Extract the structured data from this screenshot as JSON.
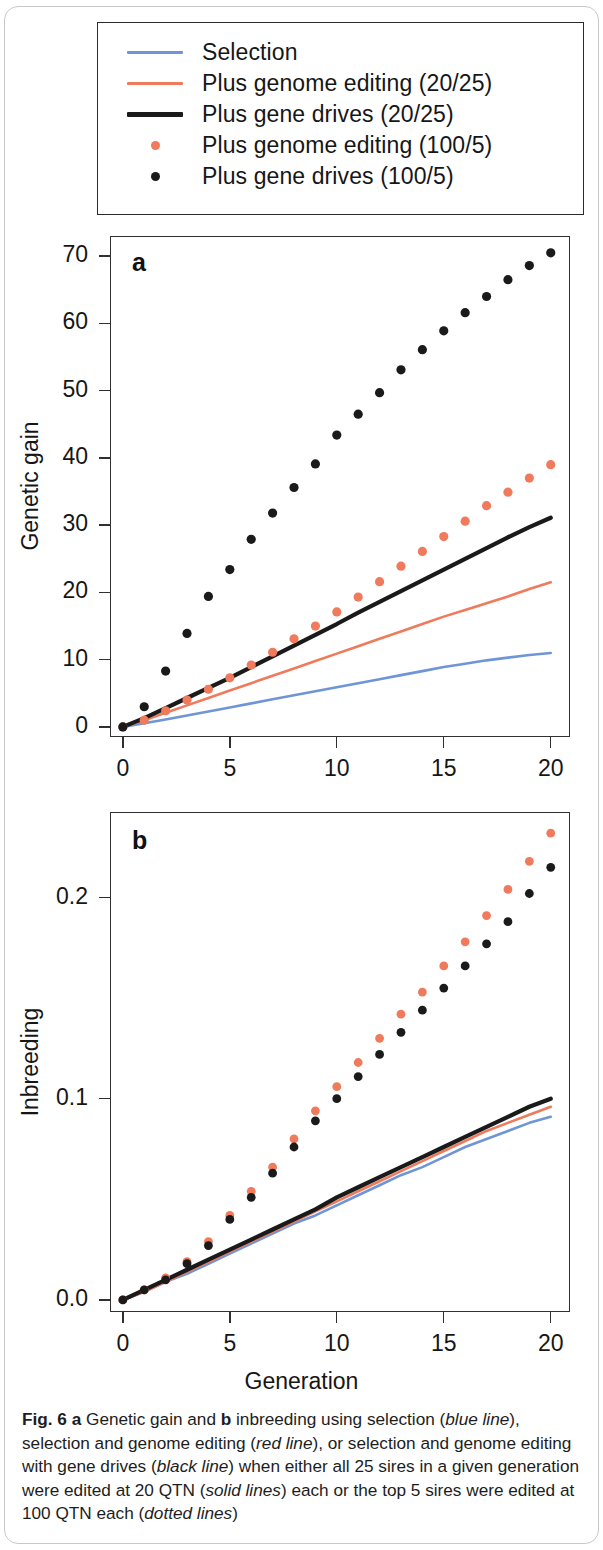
{
  "figure": {
    "label": "Fig. 6",
    "caption_segments": [
      {
        "text": "Fig. 6",
        "style": "bold"
      },
      {
        "text": " ",
        "style": "normal"
      },
      {
        "text": "a",
        "style": "bold"
      },
      {
        "text": " Genetic gain and ",
        "style": "normal"
      },
      {
        "text": "b",
        "style": "bold"
      },
      {
        "text": " inbreeding using selection (",
        "style": "normal"
      },
      {
        "text": "blue line",
        "style": "italic"
      },
      {
        "text": "), selection and genome editing (",
        "style": "normal"
      },
      {
        "text": "red line",
        "style": "italic"
      },
      {
        "text": "), or selection and genome editing with gene drives (",
        "style": "normal"
      },
      {
        "text": "black line",
        "style": "italic"
      },
      {
        "text": ") when either all 25 sires in a given generation were edited at 20 QTN (",
        "style": "normal"
      },
      {
        "text": "solid lines",
        "style": "italic"
      },
      {
        "text": ") each or the top 5 sires were edited at 100 QTN each (",
        "style": "normal"
      },
      {
        "text": "dotted lines",
        "style": "italic"
      },
      {
        "text": ")",
        "style": "normal"
      }
    ],
    "caption_plain": "Fig. 6 a Genetic gain and b inbreeding using selection (blue line), selection and genome editing (red line), or selection and genome editing with gene drives (black line) when either all 25 sires in a given generation were edited at 20 QTN (solid lines) each or the top 5 sires were edited at 100 QTN each (dotted lines)"
  },
  "colors": {
    "blue": "#6f95d8",
    "red": "#ef7a5c",
    "black": "#1a1a1a",
    "axis": "#303030",
    "text": "#161616"
  },
  "legend": {
    "entries": [
      {
        "label": "Selection",
        "marker": "line",
        "color_key": "blue",
        "thick": false
      },
      {
        "label": "Plus genome editing (20/25)",
        "marker": "line",
        "color_key": "red",
        "thick": false
      },
      {
        "label": "Plus gene drives (20/25)",
        "marker": "line",
        "color_key": "black",
        "thick": true
      },
      {
        "label": "Plus genome editing (100/5)",
        "marker": "dot",
        "color_key": "red",
        "thick": false
      },
      {
        "label": "Plus gene drives (100/5)",
        "marker": "dot",
        "color_key": "black",
        "thick": false
      }
    ]
  },
  "chart_data": [
    {
      "panel": "a",
      "type": "line",
      "title": "",
      "xlabel": "",
      "ylabel": "Genetic gain",
      "x": [
        0,
        1,
        2,
        3,
        4,
        5,
        6,
        7,
        8,
        9,
        10,
        11,
        12,
        13,
        14,
        15,
        16,
        17,
        18,
        19,
        20
      ],
      "xlim": [
        -0.6,
        20.9
      ],
      "ylim": [
        -1.5,
        73.0
      ],
      "xticks": [
        0,
        5,
        10,
        15,
        20
      ],
      "xticklabels": [
        "0",
        "5",
        "10",
        "15",
        "20"
      ],
      "yticks": [
        0,
        10,
        20,
        30,
        40,
        50,
        60,
        70
      ],
      "yticklabels": [
        "0",
        "10",
        "20",
        "30",
        "40",
        "50",
        "60",
        "70"
      ],
      "grid": false,
      "series": [
        {
          "name": "Selection",
          "style": "solid",
          "color_key": "blue",
          "values": [
            0,
            0.55,
            1.1,
            1.7,
            2.3,
            2.9,
            3.5,
            4.1,
            4.7,
            5.3,
            5.9,
            6.5,
            7.1,
            7.7,
            8.3,
            8.9,
            9.4,
            9.9,
            10.3,
            10.7,
            11.0
          ]
        },
        {
          "name": "Plus genome editing (20/25)",
          "style": "solid",
          "color_key": "red",
          "values": [
            0,
            1.0,
            2.1,
            3.2,
            4.3,
            5.4,
            6.5,
            7.6,
            8.7,
            9.8,
            10.9,
            12.0,
            13.1,
            14.2,
            15.3,
            16.4,
            17.4,
            18.4,
            19.4,
            20.5,
            21.5
          ]
        },
        {
          "name": "Plus gene drives (20/25)",
          "style": "solid",
          "color_key": "black",
          "values": [
            0,
            1.3,
            2.8,
            4.3,
            5.8,
            7.3,
            8.9,
            10.5,
            12.1,
            13.7,
            15.3,
            17.0,
            18.6,
            20.2,
            21.8,
            23.4,
            25.0,
            26.6,
            28.2,
            29.7,
            31.1
          ]
        },
        {
          "name": "Plus genome editing (100/5)",
          "style": "dotted",
          "color_key": "red",
          "values": [
            0,
            1.0,
            2.4,
            4.0,
            5.6,
            7.3,
            9.2,
            11.1,
            13.1,
            15.0,
            17.1,
            19.3,
            21.6,
            23.9,
            26.1,
            28.3,
            30.6,
            32.9,
            34.9,
            37.0,
            39.0
          ]
        },
        {
          "name": "Plus gene drives (100/5)",
          "style": "dotted",
          "color_key": "black",
          "values": [
            0,
            3.0,
            8.3,
            13.9,
            19.4,
            23.4,
            27.9,
            31.8,
            35.6,
            39.1,
            43.4,
            46.5,
            49.7,
            53.1,
            56.1,
            58.9,
            61.6,
            64.0,
            66.5,
            68.6,
            70.5
          ]
        }
      ]
    },
    {
      "panel": "b",
      "type": "line",
      "title": "",
      "xlabel": "Generation",
      "ylabel": "Inbreeding",
      "x": [
        0,
        1,
        2,
        3,
        4,
        5,
        6,
        7,
        8,
        9,
        10,
        11,
        12,
        13,
        14,
        15,
        16,
        17,
        18,
        19,
        20
      ],
      "xlim": [
        -0.6,
        20.9
      ],
      "ylim": [
        -0.006,
        0.2425
      ],
      "xticks": [
        0,
        5,
        10,
        15,
        20
      ],
      "xticklabels": [
        "0",
        "5",
        "10",
        "15",
        "20"
      ],
      "yticks": [
        0.0,
        0.1,
        0.2
      ],
      "yticklabels": [
        "0.0",
        "0.1",
        "0.2"
      ],
      "grid": false,
      "series": [
        {
          "name": "Selection",
          "style": "solid",
          "color_key": "blue",
          "values": [
            0,
            0.004,
            0.009,
            0.013,
            0.018,
            0.023,
            0.028,
            0.033,
            0.038,
            0.042,
            0.047,
            0.052,
            0.057,
            0.062,
            0.066,
            0.071,
            0.076,
            0.08,
            0.084,
            0.088,
            0.091
          ]
        },
        {
          "name": "Plus genome editing (20/25)",
          "style": "solid",
          "color_key": "red",
          "values": [
            0,
            0.004,
            0.009,
            0.014,
            0.019,
            0.024,
            0.029,
            0.034,
            0.039,
            0.044,
            0.049,
            0.054,
            0.059,
            0.064,
            0.069,
            0.074,
            0.079,
            0.084,
            0.088,
            0.092,
            0.096
          ]
        },
        {
          "name": "Plus gene drives (20/25)",
          "style": "solid",
          "color_key": "black",
          "values": [
            0,
            0.005,
            0.01,
            0.015,
            0.02,
            0.025,
            0.03,
            0.035,
            0.04,
            0.045,
            0.051,
            0.056,
            0.061,
            0.066,
            0.071,
            0.076,
            0.081,
            0.086,
            0.091,
            0.096,
            0.1
          ]
        },
        {
          "name": "Plus genome editing (100/5)",
          "style": "dotted",
          "color_key": "red",
          "values": [
            0,
            0.005,
            0.011,
            0.019,
            0.029,
            0.042,
            0.054,
            0.066,
            0.08,
            0.094,
            0.106,
            0.118,
            0.13,
            0.142,
            0.153,
            0.166,
            0.178,
            0.191,
            0.204,
            0.218,
            0.232
          ]
        },
        {
          "name": "Plus gene drives (100/5)",
          "style": "dotted",
          "color_key": "black",
          "values": [
            0,
            0.005,
            0.01,
            0.018,
            0.027,
            0.04,
            0.051,
            0.063,
            0.076,
            0.089,
            0.1,
            0.111,
            0.122,
            0.133,
            0.144,
            0.155,
            0.166,
            0.177,
            0.188,
            0.202,
            0.215
          ]
        }
      ]
    }
  ]
}
